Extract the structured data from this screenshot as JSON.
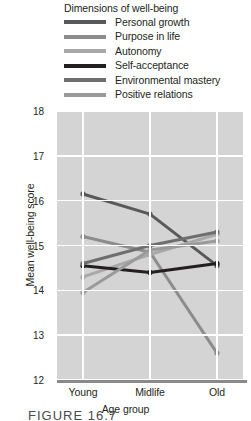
{
  "legend": {
    "title": "Dimensions of well-being",
    "items": [
      {
        "label": "Personal growth",
        "color": "#58595b"
      },
      {
        "label": "Purpose in life",
        "color": "#8c8c8c"
      },
      {
        "label": "Autonomy",
        "color": "#a8a8a8"
      },
      {
        "label": "Self-acceptance",
        "color": "#231f20"
      },
      {
        "label": "Environmental mastery",
        "color": "#6d6e70"
      },
      {
        "label": "Positive relations",
        "color": "#9a9a9a"
      }
    ]
  },
  "axes": {
    "y_title": "Mean well-being score",
    "x_title": "Age group",
    "y_ticks": [
      "18",
      "17",
      "16",
      "15",
      "14",
      "13",
      "12"
    ],
    "x_ticks": [
      "Young",
      "Midlife",
      "Old"
    ]
  },
  "caption": "FIGURE 16.7",
  "chart_data": {
    "type": "line",
    "title": "Dimensions of well-being",
    "xlabel": "Age group",
    "ylabel": "Mean well-being score",
    "categories": [
      "Young",
      "Midlife",
      "Old"
    ],
    "ylim": [
      12,
      18
    ],
    "yticks": [
      12,
      13,
      14,
      15,
      16,
      17,
      18
    ],
    "grid": true,
    "legend_position": "top",
    "series": [
      {
        "name": "Personal growth",
        "color": "#58595b",
        "values": [
          16.15,
          15.7,
          14.55
        ]
      },
      {
        "name": "Purpose in life",
        "color": "#8c8c8c",
        "values": [
          15.2,
          14.85,
          12.6
        ]
      },
      {
        "name": "Autonomy",
        "color": "#a8a8a8",
        "values": [
          14.3,
          14.8,
          15.25
        ]
      },
      {
        "name": "Self-acceptance",
        "color": "#231f20",
        "values": [
          14.55,
          14.4,
          14.6
        ]
      },
      {
        "name": "Environmental mastery",
        "color": "#6d6e70",
        "values": [
          14.6,
          15.0,
          15.3
        ]
      },
      {
        "name": "Positive relations",
        "color": "#9a9a9a",
        "values": [
          13.95,
          14.9,
          15.1
        ]
      }
    ]
  }
}
